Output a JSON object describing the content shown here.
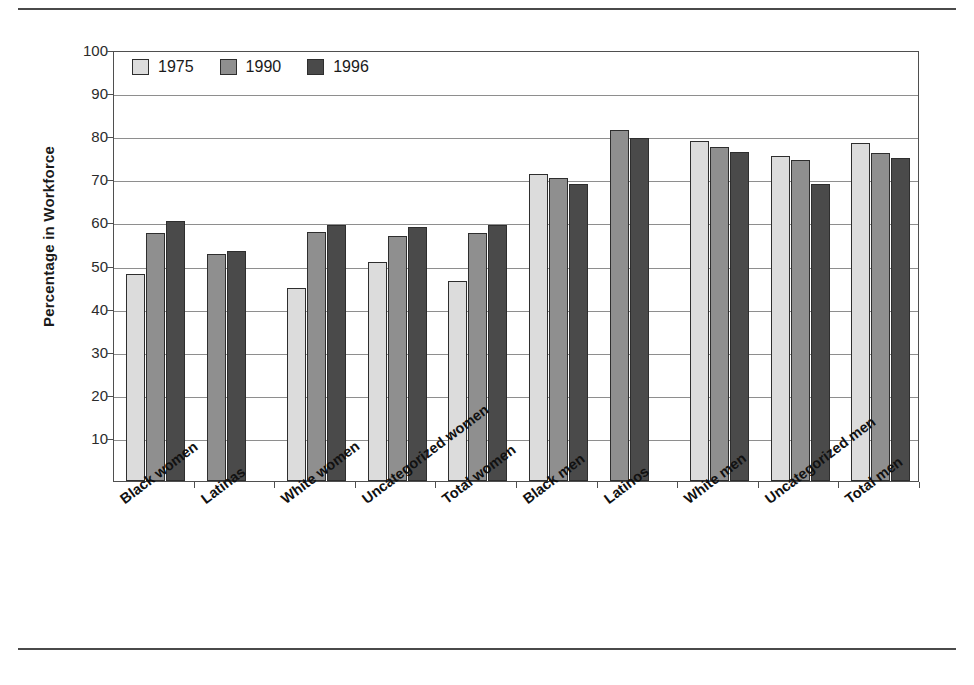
{
  "chart_data": {
    "type": "bar",
    "title": "",
    "xlabel": "",
    "ylabel": "Percentage in Workforce",
    "ylim": [
      0,
      100
    ],
    "ytick_labels": [
      "100",
      "90",
      "80",
      "70",
      "60",
      "50",
      "40",
      "30",
      "20",
      "10"
    ],
    "ytick_values": [
      100,
      90,
      80,
      70,
      60,
      50,
      40,
      30,
      20,
      10
    ],
    "grid": true,
    "legend_position": "top-left inside plot",
    "categories": [
      "Black women",
      "Latinas",
      "White women",
      "Uncategorized women",
      "Total women",
      "Black men",
      "Latinos",
      "White men",
      "Uncategorized men",
      "Total men"
    ],
    "series": [
      {
        "name": "1975",
        "color": "#dcdcdc",
        "values": [
          48.0,
          null,
          44.8,
          50.8,
          46.3,
          71.3,
          null,
          79.0,
          75.5,
          78.5
        ]
      },
      {
        "name": "1990",
        "color": "#8f8f8f",
        "values": [
          57.5,
          52.6,
          57.7,
          56.8,
          57.5,
          70.3,
          81.5,
          77.5,
          74.4,
          76.0
        ]
      },
      {
        "name": "1996",
        "color": "#4a4a4a",
        "values": [
          60.3,
          53.4,
          59.4,
          59.0,
          59.4,
          69.0,
          79.7,
          76.3,
          69.0,
          75.0
        ]
      }
    ]
  },
  "figure": {
    "top_rule": "",
    "bottom_rule": ""
  }
}
